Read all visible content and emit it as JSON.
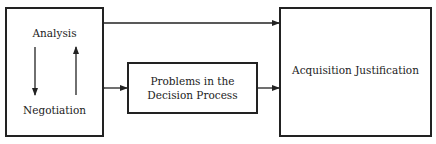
{
  "diagram": {
    "left_box": {
      "top_label": "Analysis",
      "bottom_label": "Negotiation"
    },
    "middle_box": {
      "label_line1": "Problems in the",
      "label_line2": "Decision Process"
    },
    "right_box": {
      "label": "Acquisition Justification"
    },
    "connections": [
      {
        "from": "left_box",
        "to": "right_box",
        "type": "arrow"
      },
      {
        "from": "left_box",
        "to": "middle_box",
        "type": "double-arrow"
      },
      {
        "from": "middle_box",
        "to": "right_box",
        "type": "arrow"
      },
      {
        "from": "Analysis",
        "to": "Negotiation",
        "type": "arrow"
      },
      {
        "from": "Negotiation",
        "to": "Analysis",
        "type": "arrow"
      }
    ]
  }
}
